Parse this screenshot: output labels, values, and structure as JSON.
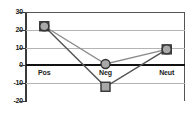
{
  "chart_data": {
    "type": "line",
    "title": "",
    "subtitle": "",
    "xlabel": "",
    "ylabel": "",
    "categories": [
      "Pos",
      "Neg",
      "Neut"
    ],
    "series": [
      {
        "name": "Series 1",
        "marker": "square",
        "color": "#555555",
        "values": [
          22,
          -12,
          9
        ]
      },
      {
        "name": "Series 2",
        "marker": "circle",
        "color": "#8c8c8c",
        "values": [
          22,
          0.8,
          9
        ]
      }
    ],
    "ylim": [
      -20,
      30
    ],
    "yticks": [
      30,
      20,
      10,
      0,
      -10,
      -20
    ],
    "ytick_labels": [
      "30",
      "20",
      "10",
      "0",
      "-10",
      "-20"
    ],
    "grid": true,
    "grid_axis": "y",
    "zero_line": true,
    "legend": "none",
    "marker_fill": "#a8a8a8",
    "marker_edge": "#333333",
    "grid_color": "#b4b4b4",
    "frame_color": "#555555",
    "axis_color": "#3a3a3a",
    "background": "#ffffff"
  }
}
